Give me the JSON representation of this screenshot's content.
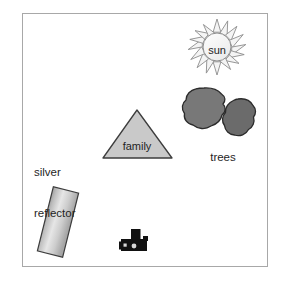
{
  "diagram": {
    "frame": {
      "x": 22,
      "y": 13,
      "width": 246,
      "height": 254,
      "border_color": "#a8a8a8",
      "background": "#ffffff"
    },
    "objects": [
      {
        "id": "sun",
        "label": "sun",
        "kind": "sun-symbol",
        "cx": 217,
        "cy": 47,
        "core_radius": 14,
        "ray_count": 16,
        "ray_length": 9,
        "fill": "#f2f2f2",
        "stroke": "#8c8c8c",
        "label_color": "#262626"
      },
      {
        "id": "trees",
        "label": "trees",
        "kind": "tree-blobs",
        "label_x": 222,
        "label_y": 155,
        "blobs": [
          {
            "id": "tree-blob-left",
            "cx": 205,
            "cy": 109,
            "rx": 20,
            "ry": 21,
            "fill": "#777777",
            "stroke": "#2b2b2b"
          },
          {
            "id": "tree-blob-right",
            "cx": 239,
            "cy": 118,
            "rx": 17,
            "ry": 19,
            "fill": "#6b6b6b",
            "stroke": "#2b2b2b"
          }
        ]
      },
      {
        "id": "family",
        "label": "family",
        "kind": "triangle",
        "apex_x": 137,
        "apex_y": 110,
        "left_x": 103,
        "left_y": 158,
        "right_x": 172,
        "right_y": 158,
        "fill": "#c9c9c9",
        "stroke": "#3d3d3d",
        "label_x": 137,
        "label_y": 143
      },
      {
        "id": "silver-reflector",
        "label": "silver\nreflector",
        "label_line_1": "silver",
        "label_line_2": "reflector",
        "kind": "tilted-rectangle",
        "label_x": 36,
        "label_y": 142,
        "cx": 58,
        "cy": 222,
        "width": 26,
        "height": 66,
        "rotation_deg": 14,
        "fill_light": "#e3e3e3",
        "fill_dark": "#9e9e9e",
        "stroke": "#3d3d3d"
      },
      {
        "id": "camera",
        "label": "camera",
        "kind": "camera-silhouette",
        "x": 121,
        "y": 230,
        "width": 26,
        "height": 21,
        "fill": "#111111"
      }
    ]
  }
}
